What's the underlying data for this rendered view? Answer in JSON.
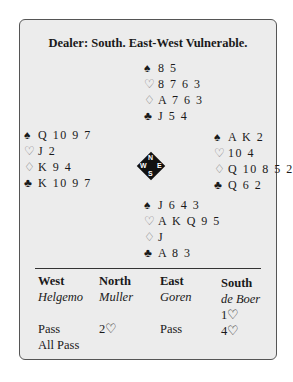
{
  "title": "Dealer: South. East-West Vulnerable.",
  "hands": {
    "north": {
      "spades": "8 5",
      "hearts": "8 7 6 3",
      "diamonds": "A 7 6 3",
      "clubs": "J 5 4"
    },
    "west": {
      "spades": "Q 10 9 7",
      "hearts": "J 2",
      "diamonds": "K 9 4",
      "clubs": "K 10 9 7"
    },
    "east": {
      "spades": "A K 2",
      "hearts": "10 4",
      "diamonds": "Q 10 8 5 2",
      "clubs": "Q 6 2"
    },
    "south": {
      "spades": "J 6 4 3",
      "hearts": "A K Q 9 5",
      "diamonds": "J",
      "clubs": "A 8 3"
    }
  },
  "suits": {
    "spades": "♠",
    "hearts": "♡",
    "diamonds": "♢",
    "clubs": "♣"
  },
  "compass": {
    "n": "N",
    "e": "E",
    "s": "S",
    "w": "W"
  },
  "auction": {
    "columns": [
      {
        "seat": "West",
        "player": "Helgemo",
        "calls": [
          "",
          "Pass",
          "All Pass"
        ]
      },
      {
        "seat": "North",
        "player": "Muller",
        "calls": [
          "",
          "2♡",
          ""
        ]
      },
      {
        "seat": "East",
        "player": "Goren",
        "calls": [
          "",
          "Pass",
          ""
        ]
      },
      {
        "seat": "South",
        "player": "de Boer",
        "calls": [
          "1♡",
          "4♡",
          ""
        ]
      }
    ]
  }
}
